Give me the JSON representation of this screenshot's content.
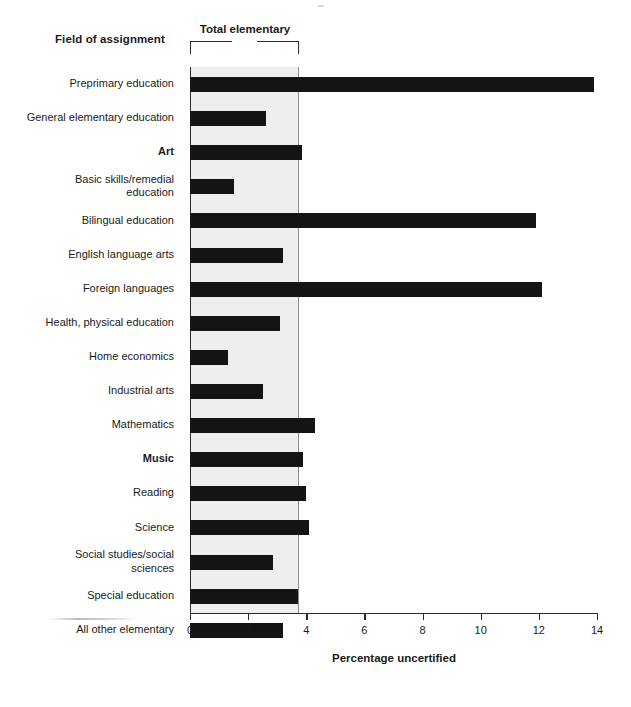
{
  "header": {
    "field_title": "Field of assignment",
    "bracket_label": "Total elementary"
  },
  "axis": {
    "x_title": "Percentage uncertified",
    "ticks": [
      "0",
      "2",
      "4",
      "6",
      "8",
      "10",
      "12",
      "14"
    ]
  },
  "chart_data": {
    "type": "bar",
    "orientation": "horizontal",
    "title": "",
    "xlabel": "Percentage uncertified",
    "ylabel": "Field of assignment",
    "xlim": [
      0,
      14
    ],
    "xticks": [
      0,
      2,
      4,
      6,
      8,
      10,
      12,
      14
    ],
    "grid": false,
    "legend": "none",
    "annotations": [
      {
        "text": "Total elementary",
        "type": "bracket",
        "x_range": [
          0,
          3.78
        ]
      }
    ],
    "bar_color": "#141414",
    "band_color": "#eeeeee",
    "categories": [
      "Preprimary education",
      "General elementary education",
      "Art",
      "Basic skills/remedial education",
      "Bilingual education",
      "English language arts",
      "Foreign languages",
      "Health, physical education",
      "Home economics",
      "Industrial arts",
      "Mathematics",
      "Music",
      "Reading",
      "Science",
      "Social studies/social sciences",
      "Special education",
      "All other elementary"
    ],
    "values": [
      13.9,
      2.6,
      3.85,
      1.5,
      11.9,
      3.2,
      12.1,
      3.1,
      1.3,
      2.5,
      4.3,
      3.9,
      4.0,
      4.1,
      2.85,
      3.7,
      3.2
    ]
  },
  "rows": [
    {
      "label": "Preprimary education",
      "value": 13.9,
      "bold": false,
      "lines": [
        "Preprimary education"
      ]
    },
    {
      "label": "General elementary education",
      "value": 2.6,
      "bold": false,
      "lines": [
        "General elementary education"
      ]
    },
    {
      "label": "Art",
      "value": 3.85,
      "bold": true,
      "lines": [
        "Art"
      ]
    },
    {
      "label": "Basic skills/remedial education",
      "value": 1.5,
      "bold": false,
      "lines": [
        "Basic skills/remedial",
        "education"
      ]
    },
    {
      "label": "Bilingual education",
      "value": 11.9,
      "bold": false,
      "lines": [
        "Bilingual education"
      ]
    },
    {
      "label": "English language arts",
      "value": 3.2,
      "bold": false,
      "lines": [
        "English language arts"
      ]
    },
    {
      "label": "Foreign languages",
      "value": 12.1,
      "bold": false,
      "lines": [
        "Foreign languages"
      ]
    },
    {
      "label": "Health, physical education",
      "value": 3.1,
      "bold": false,
      "lines": [
        "Health, physical education"
      ]
    },
    {
      "label": "Home economics",
      "value": 1.3,
      "bold": false,
      "lines": [
        "Home economics"
      ]
    },
    {
      "label": "Industrial arts",
      "value": 2.5,
      "bold": false,
      "lines": [
        "Industrial arts"
      ]
    },
    {
      "label": "Mathematics",
      "value": 4.3,
      "bold": false,
      "lines": [
        "Mathematics"
      ]
    },
    {
      "label": "Music",
      "value": 3.9,
      "bold": true,
      "lines": [
        "Music"
      ]
    },
    {
      "label": "Reading",
      "value": 4.0,
      "bold": false,
      "lines": [
        "Reading"
      ]
    },
    {
      "label": "Science",
      "value": 4.1,
      "bold": false,
      "lines": [
        "Science"
      ]
    },
    {
      "label": "Social studies/social sciences",
      "value": 2.85,
      "bold": false,
      "lines": [
        "Social studies/social",
        "sciences"
      ]
    },
    {
      "label": "Special education",
      "value": 3.7,
      "bold": false,
      "lines": [
        "Special education"
      ]
    },
    {
      "label": "All other elementary",
      "value": 3.2,
      "bold": false,
      "lines": [
        "All other elementary"
      ]
    }
  ]
}
